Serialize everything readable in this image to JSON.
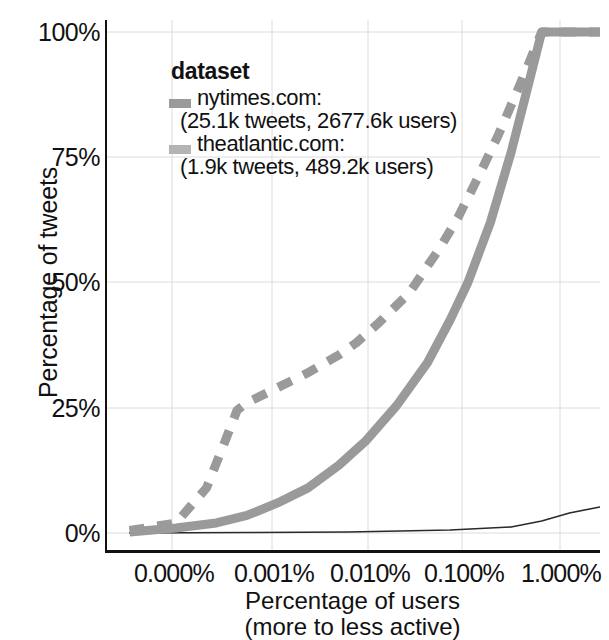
{
  "chart_data": {
    "type": "line",
    "title": "",
    "subtitle": "",
    "xlabel": "Percentage of users",
    "xlabel_sub": "(more to less active)",
    "ylabel": "Percentage of tweets",
    "x_scale": "log",
    "x_tick_labels": [
      "0.000%",
      "0.001%",
      "0.010%",
      "0.100%",
      "1.000%"
    ],
    "x_tick_values": [
      0.0001,
      0.001,
      0.01,
      0.1,
      1.0
    ],
    "y_tick_labels": [
      "0%",
      "25%",
      "50%",
      "75%",
      "100%"
    ],
    "y_tick_values": [
      0,
      25,
      50,
      75,
      100
    ],
    "ylim": [
      0,
      100
    ],
    "xlim": [
      4e-05,
      3.0
    ],
    "grid": true,
    "legend_position": "top-left-inside",
    "legend_title": "dataset",
    "series": [
      {
        "name": "nytimes.com",
        "label_line1": "nytimes.com:",
        "label_line2": "(25.1k tweets, 2677.6k users)",
        "tweets": "25.1k",
        "users": "2677.6k",
        "style": "dashed",
        "color": "#9a9a9a",
        "x": [
          7e-05,
          0.0002,
          0.0004,
          0.0006,
          0.0008,
          0.001,
          0.002,
          0.004,
          0.008,
          0.012,
          0.02,
          0.04,
          0.08,
          0.12,
          0.2,
          0.3,
          0.5,
          0.8,
          1.5,
          3.0
        ],
        "y": [
          0.5,
          2.0,
          9.0,
          18.0,
          24.5,
          26.0,
          29.0,
          32.0,
          35.5,
          38.0,
          42.0,
          48.0,
          57.0,
          63.0,
          72.0,
          79.5,
          90.0,
          100,
          100,
          100
        ]
      },
      {
        "name": "theatlantic.com",
        "label_line1": "theatlantic.com:",
        "label_line2": "(1.9k tweets, 489.2k users)",
        "tweets": "1.9k",
        "users": "489.2k",
        "style": "solid",
        "color": "#9a9a9a",
        "x": [
          7e-05,
          0.0002,
          0.0005,
          0.001,
          0.002,
          0.004,
          0.008,
          0.015,
          0.03,
          0.06,
          0.1,
          0.15,
          0.25,
          0.4,
          0.6,
          0.8,
          1.2,
          3.0
        ],
        "y": [
          0.2,
          1.0,
          2.0,
          3.5,
          6.0,
          9.0,
          13.5,
          18.5,
          25.5,
          34.0,
          42.5,
          50.0,
          62.0,
          76.0,
          90.0,
          100,
          100,
          100
        ]
      },
      {
        "name": "baseline",
        "label_line1": "",
        "label_line2": "",
        "style": "thin",
        "color": "#2a2a2a",
        "x": [
          7e-05,
          0.001,
          0.01,
          0.1,
          0.4,
          0.8,
          1.5,
          3.0
        ],
        "y": [
          0.0,
          0.1,
          0.2,
          0.6,
          1.2,
          2.4,
          4.0,
          5.2
        ]
      }
    ]
  }
}
